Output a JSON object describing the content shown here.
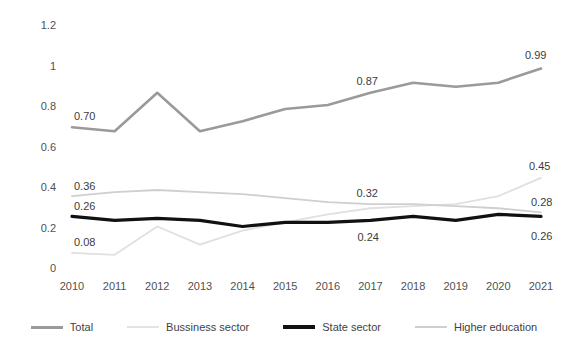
{
  "chart_data": {
    "type": "line",
    "title": "",
    "xlabel": "",
    "ylabel": "",
    "grid": false,
    "legend_position": "bottom",
    "categories": [
      "2010",
      "2011",
      "2012",
      "2013",
      "2014",
      "2015",
      "2016",
      "2017",
      "2018",
      "2019",
      "2020",
      "2021"
    ],
    "x": [
      2010,
      2011,
      2012,
      2013,
      2014,
      2015,
      2016,
      2017,
      2018,
      2019,
      2020,
      2021
    ],
    "ylim": [
      0,
      1.2
    ],
    "yticks": [
      "0",
      "0.2",
      "0.4",
      "0.6",
      "0.8",
      "1",
      "1.2"
    ],
    "ytick_values": [
      0,
      0.2,
      0.4,
      0.6,
      0.8,
      1,
      1.2
    ],
    "series": [
      {
        "name": "Total",
        "color": "#9a9a9a",
        "width": 2.6,
        "values": [
          0.7,
          0.68,
          0.87,
          0.68,
          0.73,
          0.79,
          0.81,
          0.87,
          0.92,
          0.9,
          0.92,
          0.99
        ]
      },
      {
        "name": "Bussiness sector",
        "color": "#e0e0e0",
        "width": 1.8,
        "values": [
          0.08,
          0.07,
          0.21,
          0.12,
          0.19,
          0.23,
          0.27,
          0.3,
          0.31,
          0.32,
          0.36,
          0.45
        ]
      },
      {
        "name": "State sector",
        "color": "#111111",
        "width": 3.2,
        "values": [
          0.26,
          0.24,
          0.25,
          0.24,
          0.21,
          0.23,
          0.23,
          0.24,
          0.26,
          0.24,
          0.27,
          0.26
        ]
      },
      {
        "name": "Higher education",
        "color": "#cfcfcf",
        "width": 1.8,
        "values": [
          0.36,
          0.38,
          0.39,
          0.38,
          0.37,
          0.35,
          0.33,
          0.32,
          0.32,
          0.31,
          0.3,
          0.28
        ]
      }
    ],
    "annotations": [
      {
        "text": "0.70",
        "series": "Total",
        "index": 0,
        "dx": 2,
        "dy": -16
      },
      {
        "text": "0.87",
        "series": "Total",
        "index": 7,
        "dx": -14,
        "dy": -17
      },
      {
        "text": "0.99",
        "series": "Total",
        "index": 11,
        "dx": -16,
        "dy": -19
      },
      {
        "text": "0.36",
        "series": "Higher education",
        "index": 0,
        "dx": 2,
        "dy": -15
      },
      {
        "text": "0.26",
        "series": "State sector",
        "index": 0,
        "dx": 2,
        "dy": -15
      },
      {
        "text": "0.08",
        "series": "Bussiness sector",
        "index": 0,
        "dx": 2,
        "dy": -16
      },
      {
        "text": "0.32",
        "series": "Higher education",
        "index": 7,
        "dx": -14,
        "dy": -16
      },
      {
        "text": "0.24",
        "series": "State sector",
        "index": 7,
        "dx": -13,
        "dy": 12
      },
      {
        "text": "0.45",
        "series": "Bussiness sector",
        "index": 11,
        "dx": -12,
        "dy": -17
      },
      {
        "text": "0.28",
        "series": "Higher education",
        "index": 11,
        "dx": -10,
        "dy": -15
      },
      {
        "text": "0.26",
        "series": "State sector",
        "index": 11,
        "dx": -10,
        "dy": 15
      }
    ]
  },
  "legend": {
    "items": [
      {
        "label": "Total",
        "color": "#9a9a9a",
        "width": 3
      },
      {
        "label": "Bussiness sector",
        "color": "#e3e3e3",
        "width": 2
      },
      {
        "label": "State sector",
        "color": "#111111",
        "width": 4
      },
      {
        "label": "Higher education",
        "color": "#cfcfcf",
        "width": 2
      }
    ]
  }
}
